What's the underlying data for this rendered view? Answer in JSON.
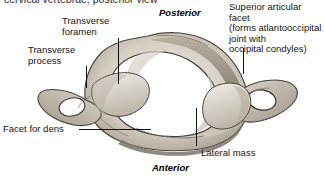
{
  "figure": {
    "caption_partial": "cervical vertebrae; posterior view"
  },
  "labels": {
    "transverse_foramen": "Transverse\nforamen",
    "transverse_foramen_line1": "Transverse",
    "transverse_foramen_line2": "foramen",
    "transverse_process_line1": "Transverse",
    "transverse_process_line2": "process",
    "facet_for_dens": "Facet for dens",
    "superior_articular_facet_line1": "Superior articular facet",
    "superior_articular_facet_line2": "(forms atlantooccipital",
    "superior_articular_facet_line3": "joint with",
    "superior_articular_facet_line4": "occipital condyles)",
    "lateral_mass": "Lateral mass"
  },
  "orientation": {
    "posterior": "Posterior",
    "anterior": "Anterior"
  },
  "colors": {
    "background": "#ffffff",
    "text": "#141414",
    "leader": "#111111",
    "bone_light": "#e8e4dd",
    "bone_mid": "#b9b2a7",
    "bone_dark": "#6d665c"
  }
}
